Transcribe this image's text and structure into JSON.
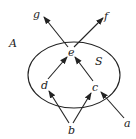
{
  "diagram": {
    "set_outer_label": "A",
    "set_inner_label": "S",
    "nodes": {
      "a": "a",
      "b": "b",
      "c": "c",
      "d": "d",
      "e": "e",
      "f": "f",
      "g": "g"
    },
    "edges": [
      {
        "from": "b",
        "to": "d"
      },
      {
        "from": "b",
        "to": "c"
      },
      {
        "from": "a",
        "to": "c"
      },
      {
        "from": "d",
        "to": "e"
      },
      {
        "from": "c",
        "to": "e"
      },
      {
        "from": "e",
        "to": "g"
      },
      {
        "from": "e",
        "to": "f"
      }
    ],
    "colors": {
      "stroke": "#222222",
      "background": "#ffffff"
    }
  }
}
